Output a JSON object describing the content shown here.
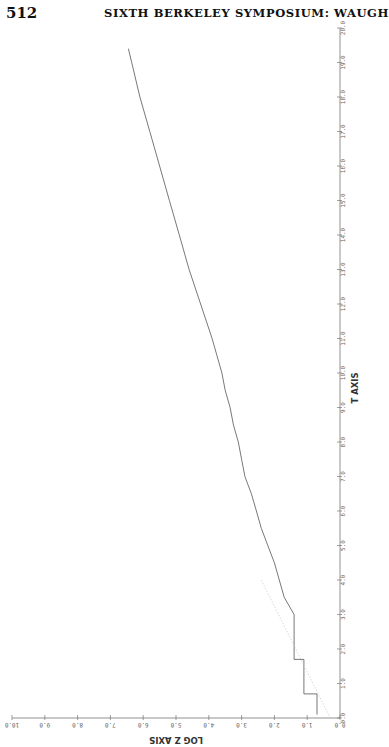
{
  "page": {
    "page_number": "512",
    "running_head": "SIXTH BERKELEY SYMPOSIUM: WAUGH"
  },
  "chart_data": {
    "type": "line",
    "title": "",
    "orientation_note": "figure printed rotated 90 degrees: T axis runs vertically on the right, LOG Z axis runs horizontally (upside down) along the bottom",
    "xlabel": "T AXIS",
    "ylabel": "LOG Z AXIS",
    "x_ticks": [
      "0.0",
      "1.0",
      "2.0",
      "3.0",
      "4.0",
      "5.0",
      "6.0",
      "7.0",
      "8.0",
      "9.0",
      "10.0",
      "11.0",
      "12.0",
      "13.0",
      "14.0",
      "15.0",
      "16.0",
      "17.0",
      "18.0",
      "19.0",
      "20.0"
    ],
    "y_ticks": [
      "0.0",
      "1.0",
      "2.0",
      "3.0",
      "4.0",
      "5.0",
      "6.0",
      "7.0",
      "8.0",
      "9.0",
      "10.0"
    ],
    "xlim": [
      0,
      20
    ],
    "ylim": [
      0,
      10
    ],
    "grid": false,
    "legend": null,
    "series": [
      {
        "name": "log Z (step path)",
        "style": "step",
        "x": [
          0.1,
          0.7,
          0.7,
          1.7,
          1.7,
          3.0,
          3.5,
          4.0,
          4.5,
          5.0,
          5.5,
          6.0,
          6.5,
          7.0,
          7.5,
          8.0,
          8.5,
          9.0,
          9.5,
          10.0,
          10.5,
          11.0,
          12.0,
          13.0,
          14.0,
          15.0,
          16.0,
          17.0,
          18.0,
          19.0,
          19.4
        ],
        "y": [
          0.7,
          0.7,
          1.1,
          1.1,
          1.4,
          1.4,
          1.7,
          1.85,
          2.0,
          2.2,
          2.4,
          2.55,
          2.7,
          2.9,
          3.0,
          3.1,
          3.25,
          3.35,
          3.5,
          3.6,
          3.75,
          3.9,
          4.25,
          4.6,
          4.9,
          5.2,
          5.5,
          5.8,
          6.1,
          6.35,
          6.45
        ]
      },
      {
        "name": "reference line (faint dotted)",
        "style": "dotted",
        "x": [
          0.0,
          4.0
        ],
        "y": [
          0.3,
          2.4
        ]
      }
    ]
  }
}
